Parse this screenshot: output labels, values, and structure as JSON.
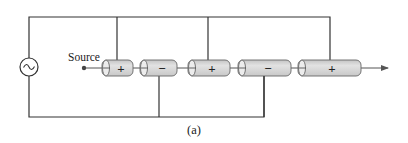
{
  "diagram": {
    "caption": "(a)",
    "source_label": "Source",
    "ac_source_symbol": "~",
    "colors": {
      "wire": "#333333",
      "cylinder_fill": "#d6d6d6",
      "cylinder_stroke": "#555555",
      "text": "#222222"
    },
    "cylinders": [
      {
        "index": 1,
        "polarity": "+",
        "x": 102,
        "width": 31,
        "tap": "top"
      },
      {
        "index": 2,
        "polarity": "−",
        "x": 140,
        "width": 37,
        "tap": "bottom"
      },
      {
        "index": 3,
        "polarity": "+",
        "x": 188,
        "width": 42,
        "tap": "top"
      },
      {
        "index": 4,
        "polarity": "−",
        "x": 238,
        "width": 53,
        "tap": "bottom"
      },
      {
        "index": 5,
        "polarity": "+",
        "x": 298,
        "width": 63,
        "tap": "top"
      }
    ]
  }
}
